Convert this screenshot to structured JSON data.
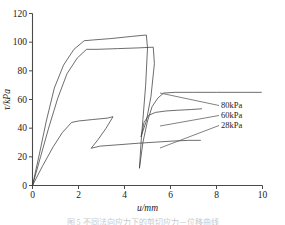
{
  "chart_data": {
    "type": "line",
    "title": "",
    "xlabel": "u/mm",
    "ylabel": "τ/kPa",
    "xlim": [
      0,
      10
    ],
    "ylim": [
      0,
      120
    ],
    "xticks": [
      0,
      2,
      4,
      6,
      8,
      10
    ],
    "yticks": [
      0,
      20,
      40,
      60,
      80,
      100,
      120
    ],
    "xtick_labels": [
      "0",
      "2",
      "4",
      "6",
      "8",
      "10"
    ],
    "ytick_labels": [
      "0",
      "20",
      "40",
      "60",
      "80",
      "100",
      "120"
    ],
    "grid": false,
    "legend_position": "right-inside",
    "legend_style": "leader-lines",
    "series": [
      {
        "name": "80kPa",
        "label": "80kPa",
        "color": "#3c3c3c",
        "peak_tau": 105,
        "residual_tau": 65,
        "points": [
          [
            0.0,
            0
          ],
          [
            0.3,
            22
          ],
          [
            0.6,
            45
          ],
          [
            0.95,
            68
          ],
          [
            1.35,
            84
          ],
          [
            1.8,
            95
          ],
          [
            2.25,
            101
          ],
          [
            2.6,
            101.5
          ],
          [
            3.4,
            102.5
          ],
          [
            4.3,
            104
          ],
          [
            4.95,
            105
          ],
          [
            5.0,
            96
          ],
          [
            4.92,
            70
          ],
          [
            4.8,
            46
          ],
          [
            4.72,
            30
          ],
          [
            4.65,
            12
          ],
          [
            4.8,
            30
          ],
          [
            5.0,
            45
          ],
          [
            5.2,
            55
          ],
          [
            5.45,
            61
          ],
          [
            5.7,
            64.5
          ],
          [
            6.2,
            65
          ],
          [
            7.0,
            65
          ],
          [
            8.0,
            65
          ],
          [
            9.2,
            65
          ],
          [
            9.95,
            65
          ]
        ]
      },
      {
        "name": "60kPa",
        "label": "60kPa",
        "color": "#3c3c3c",
        "peak_tau": 96,
        "residual_tau": 53,
        "points": [
          [
            0.0,
            0
          ],
          [
            0.35,
            20
          ],
          [
            0.7,
            40
          ],
          [
            1.1,
            61
          ],
          [
            1.5,
            78
          ],
          [
            1.95,
            89
          ],
          [
            2.35,
            95
          ],
          [
            2.8,
            95
          ],
          [
            3.7,
            95.5
          ],
          [
            4.6,
            96
          ],
          [
            5.25,
            96.5
          ],
          [
            5.3,
            85
          ],
          [
            5.15,
            62
          ],
          [
            4.95,
            45
          ],
          [
            4.8,
            38
          ],
          [
            4.72,
            34
          ],
          [
            4.85,
            44
          ],
          [
            5.05,
            49
          ],
          [
            5.35,
            51
          ],
          [
            5.8,
            52
          ],
          [
            6.3,
            52.5
          ],
          [
            6.9,
            53
          ],
          [
            7.35,
            53.5
          ]
        ]
      },
      {
        "name": "28kPa",
        "label": "28kPa",
        "color": "#3c3c3c",
        "peak_tau": 48,
        "residual_tau": 31,
        "points": [
          [
            0.0,
            0
          ],
          [
            0.45,
            14
          ],
          [
            0.9,
            27
          ],
          [
            1.3,
            37
          ],
          [
            1.7,
            44
          ],
          [
            2.0,
            45
          ],
          [
            2.6,
            46
          ],
          [
            3.25,
            47
          ],
          [
            3.5,
            48
          ],
          [
            3.2,
            40
          ],
          [
            2.85,
            32
          ],
          [
            2.55,
            26
          ],
          [
            2.95,
            27.5
          ],
          [
            3.8,
            28.5
          ],
          [
            4.6,
            29.5
          ],
          [
            5.4,
            30.3
          ],
          [
            6.1,
            31
          ],
          [
            6.8,
            31.5
          ],
          [
            7.3,
            31.5
          ]
        ]
      }
    ],
    "legend_entries": [
      {
        "label": "80kPa",
        "anchor_x": 221,
        "anchor_y": 108,
        "leader_from_x": 160,
        "leader_from_y": 93
      },
      {
        "label": "60kPa",
        "anchor_x": 221,
        "anchor_y": 118,
        "leader_from_x": 160,
        "leader_from_y": 126
      },
      {
        "label": "28kPa",
        "anchor_x": 221,
        "anchor_y": 128,
        "leader_from_x": 160,
        "leader_from_y": 148
      }
    ]
  },
  "caption": {
    "text": "图 5  不同法向应力下的剪切应力－位移曲线"
  }
}
